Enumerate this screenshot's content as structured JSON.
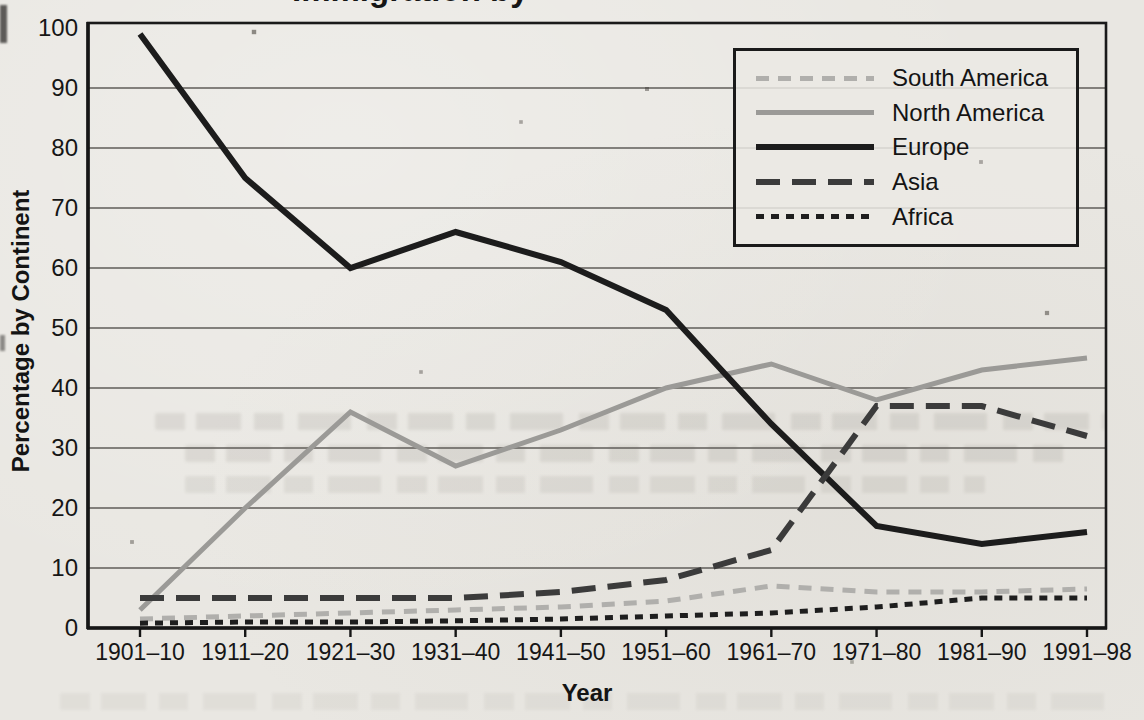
{
  "page": {
    "paper_color": "#e9e7e2",
    "text_color": "#1a1a1a"
  },
  "chart_data": {
    "type": "line",
    "title_fragment": "Immigration by",
    "xlabel": "Year",
    "ylabel": "Percentage by Continent",
    "ylim": [
      0,
      100
    ],
    "yticks": [
      0,
      10,
      20,
      30,
      40,
      50,
      60,
      70,
      80,
      90,
      100
    ],
    "grid": "horizontal",
    "legend_position": "top-right",
    "categories": [
      "1901–10",
      "1911–20",
      "1921–30",
      "1931–40",
      "1941–50",
      "1951–60",
      "1961–70",
      "1971–80",
      "1981–90",
      "1991–98"
    ],
    "series": [
      {
        "name": "South America",
        "values": [
          1.5,
          2,
          2.5,
          3,
          3.5,
          4.5,
          7,
          6,
          6,
          6.5
        ],
        "color": "#b0afac",
        "style": "dashed-medium",
        "line_width": 5
      },
      {
        "name": "North America",
        "values": [
          3,
          20,
          36,
          27,
          33,
          40,
          44,
          38,
          43,
          45
        ],
        "color": "#9b9a97",
        "style": "solid",
        "line_width": 5
      },
      {
        "name": "Europe",
        "values": [
          99,
          75,
          60,
          66,
          61,
          53,
          34,
          17,
          14,
          16
        ],
        "color": "#1c1c1c",
        "style": "solid",
        "line_width": 6
      },
      {
        "name": "Asia",
        "values": [
          5,
          5,
          5,
          5,
          6,
          8,
          13,
          37,
          37,
          32
        ],
        "color": "#3b3b3b",
        "style": "dashed-long",
        "line_width": 6
      },
      {
        "name": "Africa",
        "values": [
          0.8,
          1,
          1,
          1.2,
          1.5,
          2,
          2.5,
          3.5,
          5,
          5
        ],
        "color": "#1e1e1e",
        "style": "dotted",
        "line_width": 5
      }
    ]
  }
}
